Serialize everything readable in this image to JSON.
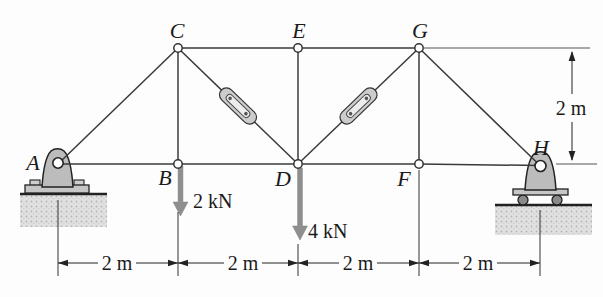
{
  "figure": {
    "type": "truss-structure-diagram",
    "joints": {
      "A": "A",
      "B": "B",
      "C": "C",
      "D": "D",
      "E": "E",
      "F": "F",
      "G": "G",
      "H": "H"
    },
    "loads": {
      "at_B": "2 kN",
      "at_D": "4 kN"
    },
    "dimensions": {
      "span_AB": "2 m",
      "span_BD": "2 m",
      "span_DF": "2 m",
      "span_FH": "2 m",
      "height_right": "2 m"
    },
    "supports": {
      "at_A": "pin-support",
      "at_H": "roller-support"
    },
    "turnbuckles": [
      "member-CD",
      "member-DG"
    ],
    "colors": {
      "member_line": "#3a3a3a",
      "load_arrow": "#8f8f8f",
      "support_fill": "#bcbcbc",
      "ground_fill": "#e0e0e0",
      "text": "#1a1a1a",
      "background": "#fdfdfd"
    }
  }
}
